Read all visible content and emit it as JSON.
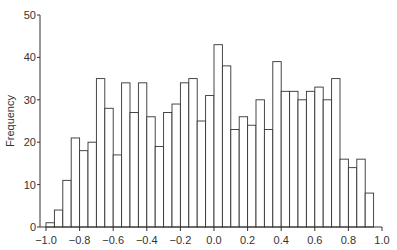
{
  "chart_data": {
    "type": "bar",
    "subtype": "histogram",
    "title": "",
    "xlabel": "",
    "ylabel": "Frequency",
    "xlim": [
      -1.0,
      1.0
    ],
    "ylim": [
      0,
      50
    ],
    "bin_width": 0.05,
    "x_ticks": [
      "-1.0",
      "-0.8",
      "-0.6",
      "-0.4",
      "-0.2",
      "0.0",
      "0.2",
      "0.4",
      "0.6",
      "0.8",
      "1.0"
    ],
    "y_ticks": [
      "0",
      "10",
      "20",
      "30",
      "40",
      "50"
    ],
    "grid": false,
    "legend": null,
    "bin_starts": [
      -1.0,
      -0.95,
      -0.9,
      -0.85,
      -0.8,
      -0.75,
      -0.7,
      -0.65,
      -0.6,
      -0.55,
      -0.5,
      -0.45,
      -0.4,
      -0.35,
      -0.3,
      -0.25,
      -0.2,
      -0.15,
      -0.1,
      -0.05,
      0.0,
      0.05,
      0.1,
      0.15,
      0.2,
      0.25,
      0.3,
      0.35,
      0.4,
      0.45,
      0.5,
      0.55,
      0.6,
      0.65,
      0.7,
      0.75,
      0.8,
      0.85,
      0.9
    ],
    "values": [
      1,
      4,
      11,
      21,
      18,
      20,
      35,
      28,
      17,
      34,
      27,
      34,
      26,
      19,
      27,
      29,
      34,
      35,
      25,
      31,
      43,
      38,
      23,
      26,
      24,
      30,
      23,
      39,
      32,
      32,
      30,
      32,
      33,
      30,
      35,
      16,
      14,
      16,
      8
    ],
    "colors": {
      "bar_fill": "#ffffff",
      "bar_stroke": "#333333",
      "axis": "#333333"
    }
  }
}
